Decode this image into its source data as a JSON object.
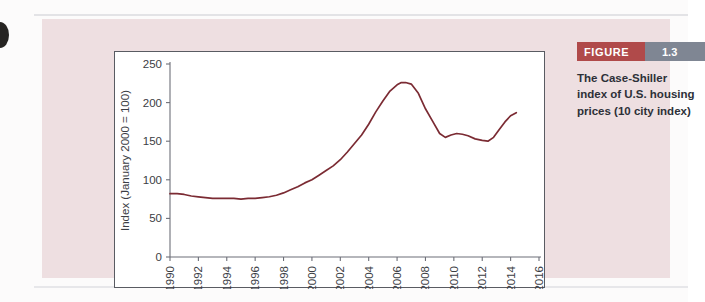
{
  "figure": {
    "badge_label": "FIGURE",
    "badge_number": "1.3",
    "caption": "The Case-Shiller index of U.S. housing prices (10 city index)",
    "accent_red": "#b04a4a",
    "accent_gray": "#7f8693",
    "panel_color": "#eedfe1",
    "line_color": "#7b2b33"
  },
  "chart_data": {
    "type": "line",
    "title": "",
    "xlabel": "",
    "ylabel": "Index (January 2000 = 100)",
    "xlim": [
      1990,
      2016
    ],
    "ylim": [
      0,
      250
    ],
    "xticks": [
      1990,
      1992,
      1994,
      1996,
      1998,
      2000,
      2002,
      2004,
      2006,
      2008,
      2010,
      2012,
      2014,
      2016
    ],
    "xtick_labels": [
      "1990",
      "1992",
      "1994",
      "1996",
      "1998",
      "2000",
      "2002",
      "2004",
      "2006",
      "2008",
      "2010",
      "2012",
      "2014",
      "2016"
    ],
    "yticks": [
      0,
      50,
      100,
      150,
      200,
      250
    ],
    "ytick_labels": [
      "0",
      "50",
      "100",
      "150",
      "200",
      "250"
    ],
    "grid": false,
    "legend": null,
    "series": [
      {
        "name": "Case-Shiller 10-city index",
        "color": "#7b2b33",
        "x": [
          1990.0,
          1990.5,
          1991.0,
          1991.5,
          1992.0,
          1992.5,
          1993.0,
          1993.5,
          1994.0,
          1994.5,
          1995.0,
          1995.5,
          1996.0,
          1996.5,
          1997.0,
          1997.5,
          1998.0,
          1998.5,
          1999.0,
          1999.5,
          2000.0,
          2000.5,
          2001.0,
          2001.5,
          2002.0,
          2002.5,
          2003.0,
          2003.5,
          2004.0,
          2004.5,
          2005.0,
          2005.5,
          2006.0,
          2006.3,
          2006.6,
          2007.0,
          2007.5,
          2008.0,
          2008.5,
          2009.0,
          2009.4,
          2009.8,
          2010.2,
          2010.6,
          2011.0,
          2011.5,
          2012.0,
          2012.4,
          2012.8,
          2013.2,
          2013.6,
          2014.0,
          2014.4
        ],
        "y": [
          82,
          82,
          81,
          79,
          78,
          77,
          76,
          76,
          76,
          76,
          75,
          76,
          76,
          77,
          78,
          80,
          83,
          87,
          91,
          96,
          100,
          106,
          112,
          118,
          126,
          136,
          147,
          158,
          172,
          188,
          202,
          215,
          223,
          226,
          226,
          224,
          212,
          192,
          176,
          160,
          155,
          158,
          160,
          159,
          157,
          153,
          151,
          150,
          155,
          165,
          175,
          183,
          187
        ]
      }
    ]
  }
}
